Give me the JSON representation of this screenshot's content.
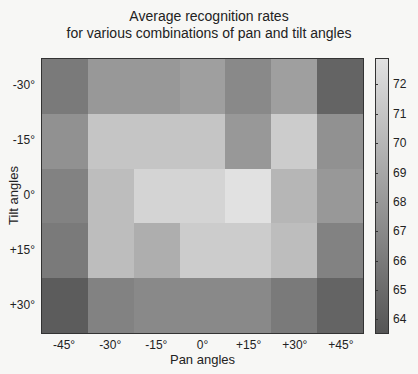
{
  "chart_data": {
    "type": "heatmap",
    "title": "Average recognition rates",
    "subtitle": "for various combinations of pan and tilt angles",
    "xlabel": "Pan angles",
    "ylabel": "Tilt angles",
    "x_categories": [
      "-45°",
      "-30°",
      "-15°",
      "0°",
      "+15°",
      "+30°",
      "+45°"
    ],
    "y_categories": [
      "-30°",
      "-15°",
      "0°",
      "+15°",
      "+30°"
    ],
    "values": [
      [
        66.0,
        68.0,
        68.0,
        68.5,
        67.0,
        68.5,
        64.5
      ],
      [
        67.5,
        71.0,
        71.0,
        71.0,
        68.0,
        71.5,
        67.5
      ],
      [
        66.5,
        70.5,
        72.0,
        72.0,
        73.0,
        70.0,
        68.0
      ],
      [
        66.0,
        70.5,
        69.5,
        71.5,
        71.5,
        70.5,
        66.5
      ],
      [
        64.0,
        66.5,
        67.0,
        67.0,
        67.0,
        66.0,
        64.5
      ]
    ],
    "colorbar": {
      "ticks": [
        72,
        71,
        70,
        69,
        68,
        67,
        66,
        65,
        64
      ],
      "range": [
        63.5,
        72.9
      ],
      "colormap": "gray"
    },
    "grid": false
  }
}
